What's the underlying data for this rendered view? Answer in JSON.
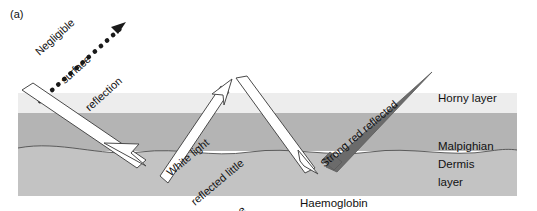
{
  "figure": {
    "panel_label": "(a)",
    "caption_haemoglobin_line1": "Haemoglobin",
    "caption_haemoglobin_line2": "(green absorbed)"
  },
  "layers": [
    {
      "name": "horny-layer",
      "label": "Horny layer",
      "color": "#ededed",
      "y_top": 93,
      "y_bottom": 113
    },
    {
      "name": "malpighian-layer",
      "label_line1": "Malpighian",
      "label_line2": "layer",
      "color": "#b4b4b4",
      "y_top": 113,
      "y_bottom": 151
    },
    {
      "name": "dermis-layer",
      "label": "Dermis",
      "color": "#c3c3c3",
      "y_top": 151,
      "y_bottom": 196
    }
  ],
  "rays": [
    {
      "name": "negligible-surface-reflection",
      "label_line1": "Negligible",
      "label_line2": "surface",
      "label_line3": "reflection",
      "style": "dotted",
      "color": "#1a1a1a"
    },
    {
      "name": "white-light-reflected-little-change",
      "label_line1": "White light",
      "label_line2": "reflected little",
      "label_line3": "change",
      "style": "white-beam",
      "color": "#ffffff"
    },
    {
      "name": "strong-red-reflected",
      "label": "Strong red reflected",
      "style": "solid-beam",
      "color": "#6b6b6b"
    }
  ],
  "colors": {
    "background": "#ffffff",
    "horny": "#ededed",
    "malpighian": "#b4b4b4",
    "dermis": "#c3c3c3",
    "beam_fill": "#ffffff",
    "beam_stroke": "#4a4a4a",
    "red_beam": "#6b6b6b",
    "text": "#111111"
  }
}
